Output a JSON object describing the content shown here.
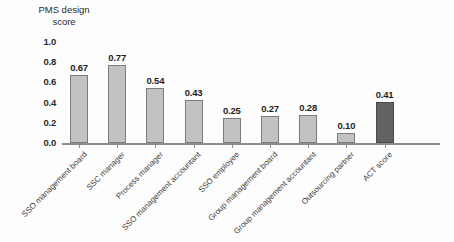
{
  "chart_data": {
    "type": "bar",
    "title": "PMS design\nscore",
    "xlabel": "",
    "ylabel": "PMS design score",
    "ylim": [
      0,
      1.0
    ],
    "ytick_labels": [
      "0.0",
      "0.2",
      "0.4",
      "0.6",
      "0.8",
      "1.0"
    ],
    "ytick_values": [
      0.0,
      0.2,
      0.4,
      0.6,
      0.8,
      1.0
    ],
    "grid": false,
    "legend": "none",
    "categories": [
      "SSO management board",
      "SSC manager",
      "Process manager",
      "SSO management accountant",
      "SSO employee",
      "Group management board",
      "Group management accountant",
      "Outsourcing partner",
      "ACT score"
    ],
    "values": [
      0.67,
      0.77,
      0.54,
      0.43,
      0.25,
      0.27,
      0.28,
      0.1,
      0.41
    ],
    "value_labels": [
      "0.67",
      "0.77",
      "0.54",
      "0.43",
      "0.25",
      "0.27",
      "0.28",
      "0.10",
      "0.41"
    ],
    "bar_colors": [
      "#c2c2c2",
      "#c2c2c2",
      "#c2c2c2",
      "#c2c2c2",
      "#c2c2c2",
      "#c2c2c2",
      "#c2c2c2",
      "#c2c2c2",
      "#636363"
    ],
    "accent_index": 8,
    "accent_color": "#636363",
    "bar_color": "#c2c2c2",
    "bar_border_color": "#7d7d7d",
    "axis_color": "#8c8c8c",
    "text_color": "#2b2b2b",
    "background": "#fdfdfd"
  }
}
